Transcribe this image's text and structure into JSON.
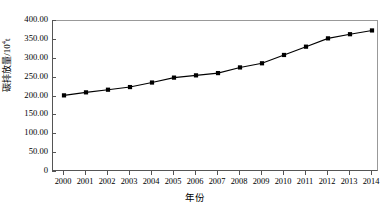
{
  "chart_data": {
    "type": "line",
    "title": "",
    "xlabel": "年份",
    "ylabel": "碳排放量/10⁴t",
    "ylabel_text": "碳排放量/10",
    "ylabel_exponent": "4",
    "ylabel_unit_suffix": "t",
    "categories": [
      "2000",
      "2001",
      "2002",
      "2003",
      "2004",
      "2005",
      "2006",
      "2007",
      "2008",
      "2009",
      "2010",
      "2011",
      "2012",
      "2013",
      "2014"
    ],
    "x": [
      2000,
      2001,
      2002,
      2003,
      2004,
      2005,
      2006,
      2007,
      2008,
      2009,
      2010,
      2011,
      2012,
      2013,
      2014
    ],
    "values": [
      203,
      211,
      218,
      225,
      237,
      250,
      256,
      262,
      277,
      288,
      310,
      332,
      354,
      365,
      375
    ],
    "series": [
      {
        "name": "碳排放量",
        "values": [
          203,
          211,
          218,
          225,
          237,
          250,
          256,
          262,
          277,
          288,
          310,
          332,
          354,
          365,
          375
        ]
      }
    ],
    "ylim": [
      0,
      400
    ],
    "xlim": [
      2000,
      2014
    ],
    "yticks": [
      0,
      50,
      100,
      150,
      200,
      250,
      300,
      350,
      400
    ],
    "ytick_labels": [
      "0",
      "50.00",
      "100.00",
      "150.00",
      "200.00",
      "250.00",
      "300.00",
      "350.00",
      "400.00"
    ],
    "grid": false,
    "legend": false,
    "legend_position": "none",
    "marker": "square",
    "marker_color": "#000000",
    "line_color": "#000000",
    "background_color": "#ffffff",
    "axis_color": "#555555"
  }
}
